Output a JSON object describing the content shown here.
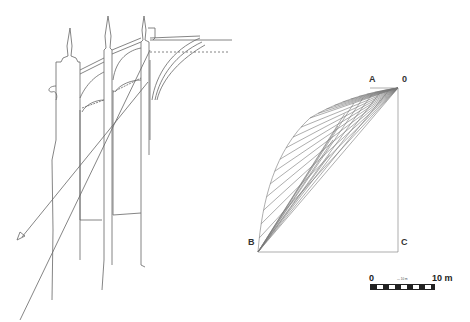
{
  "figure": {
    "left_panel": {
      "description": "Gothic cathedral cross-section with flying buttresses and thrust line arrow"
    },
    "right_panel": {
      "labels": {
        "A": "A",
        "origin": "0",
        "B": "B",
        "C": "C"
      },
      "description": "Funicular force polygon / thrust-line construction"
    },
    "scale_bar": {
      "start": "0",
      "end": "10 m",
      "small_text": "— 10 m"
    }
  },
  "colors": {
    "line": "#555555",
    "background": "#ffffff"
  }
}
